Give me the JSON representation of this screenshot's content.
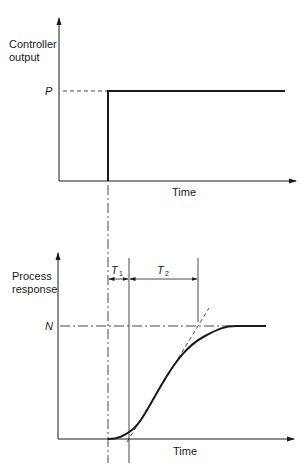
{
  "top_chart": {
    "y_label_line1": "Controller",
    "y_label_line2": "output",
    "level_label": "P",
    "x_label": "Time"
  },
  "bottom_chart": {
    "y_label_line1": "Process",
    "y_label_line2": "response",
    "level_label": "N",
    "x_label": "Time",
    "interval1_label": "T",
    "interval1_sub": "1",
    "interval2_label": "T",
    "interval2_sub": "2"
  },
  "colors": {
    "ink": "#1a1a1a",
    "background": "#ffffff"
  }
}
